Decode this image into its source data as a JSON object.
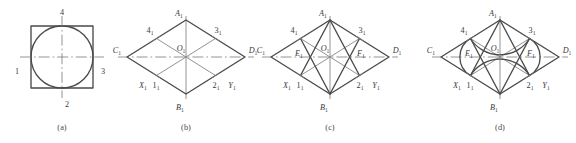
{
  "figure": {
    "stroke_color": "#4a4a4a",
    "thin_color": "#6e6e6e",
    "center_line_color": "#7a7a7a",
    "background": "#ffffff"
  },
  "panels": [
    {
      "id": "a",
      "caption": "(a)",
      "kind": "square-with-inscribed-circle",
      "labels": {
        "top": "4",
        "left": "1",
        "right": "3",
        "bottom": "2"
      }
    },
    {
      "id": "b",
      "caption": "(b)",
      "kind": "isometric-rhombus",
      "labels": {
        "top_vertex": "A",
        "top_vertex_sub": "1",
        "bottom_vertex": "B",
        "bottom_vertex_sub": "1",
        "left_vertex": "C",
        "left_vertex_sub": "1",
        "right_vertex": "D",
        "right_vertex_sub": "1",
        "center": "O",
        "center_sub": "1",
        "mid_upper_left": "4",
        "mid_upper_left_sub": "1",
        "mid_upper_right": "3",
        "mid_upper_right_sub": "1",
        "mid_lower_left": "1",
        "mid_lower_left_sub": "1",
        "mid_lower_right": "2",
        "mid_lower_right_sub": "1",
        "axis_left": "X",
        "axis_left_sub": "1",
        "axis_right": "Y",
        "axis_right_sub": "1"
      }
    },
    {
      "id": "c",
      "caption": "(c)",
      "kind": "rhombus-with-construction-lines",
      "labels": {
        "top_vertex": "A",
        "top_vertex_sub": "1",
        "bottom_vertex": "B",
        "bottom_vertex_sub": "1",
        "left_vertex": "C",
        "left_vertex_sub": "1",
        "right_vertex": "D",
        "right_vertex_sub": "1",
        "center": "O",
        "center_sub": "1",
        "mid_upper_left": "4",
        "mid_upper_left_sub": "1",
        "mid_upper_right": "3",
        "mid_upper_right_sub": "1",
        "mid_lower_left": "1",
        "mid_lower_left_sub": "1",
        "mid_lower_right": "2",
        "mid_lower_right_sub": "1",
        "axis_left": "X",
        "axis_left_sub": "1",
        "axis_right": "Y",
        "axis_right_sub": "1",
        "arc_center_left": "E",
        "arc_center_left_sub": "1",
        "arc_center_right": "F",
        "arc_center_right_sub": "1"
      }
    },
    {
      "id": "d",
      "caption": "(d)",
      "kind": "completed-four-arc-ellipse",
      "labels": {
        "top_vertex": "A",
        "top_vertex_sub": "1",
        "bottom_vertex": "B",
        "bottom_vertex_sub": "1",
        "left_vertex": "C",
        "left_vertex_sub": "1",
        "right_vertex": "D",
        "right_vertex_sub": "1",
        "center": "O",
        "center_sub": "1",
        "mid_upper_left": "4",
        "mid_upper_left_sub": "1",
        "mid_upper_right": "3",
        "mid_upper_right_sub": "1",
        "mid_lower_left": "1",
        "mid_lower_left_sub": "1",
        "mid_lower_right": "2",
        "mid_lower_right_sub": "1",
        "axis_left": "X",
        "axis_left_sub": "1",
        "axis_right": "Y",
        "axis_right_sub": "1",
        "arc_center_left": "E",
        "arc_center_left_sub": "1",
        "arc_center_right": "F",
        "arc_center_right_sub": "1"
      }
    }
  ]
}
